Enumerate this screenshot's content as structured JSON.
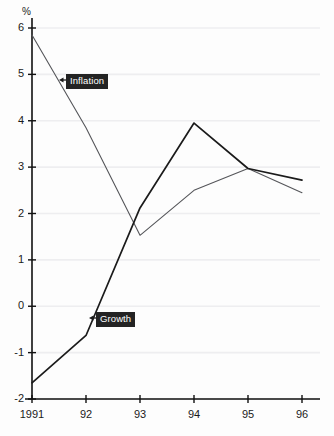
{
  "chart_data": {
    "type": "line",
    "title": "",
    "subtitle": "",
    "xlabel": "",
    "ylabel": "%",
    "ylim": [
      -2,
      6
    ],
    "xlim": [
      1991,
      1996
    ],
    "grid": true,
    "grid_axis": "y",
    "legend_position": "inline-annotations",
    "x": [
      1991,
      1992,
      1993,
      1994,
      1995,
      1996
    ],
    "categories": [
      "1991",
      "92",
      "93",
      "94",
      "95",
      "96"
    ],
    "ytick_labels": [
      "6",
      "5",
      "4",
      "3",
      "2",
      "1",
      "0",
      "-1",
      "-2"
    ],
    "ytick_values": [
      6,
      5,
      4,
      3,
      2,
      1,
      0,
      -1,
      -2
    ],
    "series": [
      {
        "name": "Inflation",
        "color": "#55565a",
        "width": 1.1,
        "values": [
          5.85,
          3.85,
          1.53,
          2.5,
          2.97,
          2.45
        ]
      },
      {
        "name": "Growth",
        "color": "#1b1b1b",
        "width": 1.7,
        "values": [
          -1.65,
          -0.63,
          2.12,
          3.95,
          2.97,
          2.72
        ]
      }
    ],
    "annotations": [
      {
        "text": "Inflation",
        "series": "Inflation",
        "style": "dark-box-left-arrow"
      },
      {
        "text": "Growth",
        "series": "Growth",
        "style": "dark-box-left-arrow"
      }
    ]
  },
  "axis": {
    "unit_label": "%"
  },
  "colors": {
    "background": "#fdfdfd",
    "axis": "#111111",
    "gridline": "#eeeef0",
    "inflation": "#55565a",
    "growth": "#1b1b1b",
    "tag_background": "#232323",
    "tag_text": "#ffffff"
  }
}
